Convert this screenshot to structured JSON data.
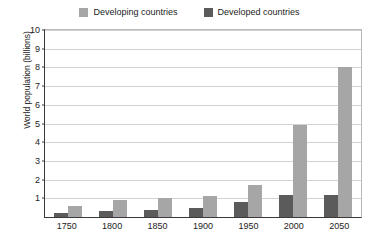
{
  "chart_data": {
    "type": "bar",
    "title": "",
    "subtitle": "",
    "xlabel": "",
    "ylabel": "World population (billions)",
    "categories": [
      "1750",
      "1800",
      "1850",
      "1900",
      "1950",
      "2000",
      "2050"
    ],
    "series": [
      {
        "name": "Developing countries",
        "color": "#a6a6a6",
        "values": [
          0.6,
          0.9,
          1.0,
          1.1,
          1.7,
          4.9,
          8.0
        ]
      },
      {
        "name": "Developed countries",
        "color": "#5b5b5b",
        "values": [
          0.2,
          0.3,
          0.4,
          0.5,
          0.8,
          1.2,
          1.2
        ]
      }
    ],
    "ylim": [
      0,
      10
    ],
    "yticks": [
      1,
      2,
      3,
      4,
      5,
      6,
      7,
      8,
      9,
      10
    ],
    "ytick_labels": [
      "1",
      "2",
      "3",
      "4",
      "5",
      "6",
      "7",
      "8",
      "9",
      "10"
    ],
    "grid": true,
    "grid_axis": "y",
    "legend_position": "top-center",
    "bar_order": [
      "Developed countries",
      "Developing countries"
    ]
  },
  "legend": {
    "entries": [
      {
        "label": "Developing countries",
        "color": "#a6a6a6"
      },
      {
        "label": "Developed countries",
        "color": "#5b5b5b"
      }
    ]
  },
  "axes": {
    "y_title": "World population (billions)"
  },
  "colors": {
    "developing": "#a6a6a6",
    "developed": "#5b5b5b",
    "axis": "#3a3a3a",
    "grid": "#d2d2d2",
    "text": "#1c1c1c",
    "background": "#ffffff"
  }
}
